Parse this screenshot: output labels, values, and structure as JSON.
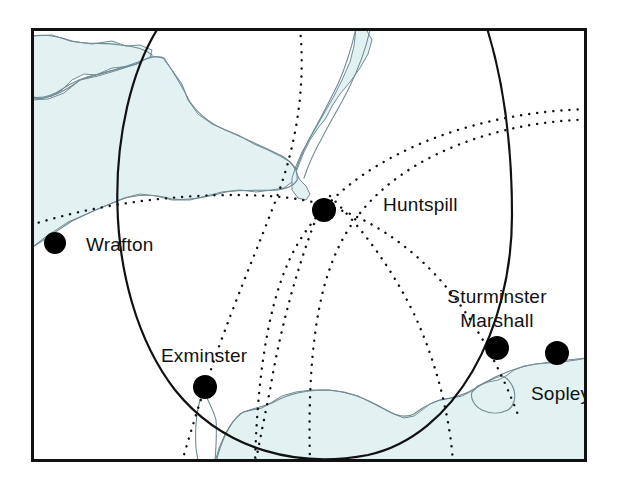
{
  "figure": {
    "type": "locator-map",
    "frame": {
      "x": 31,
      "y": 28,
      "width": 556,
      "height": 434,
      "stroke": "#111111",
      "stroke_width": 3,
      "fill": "#ffffff"
    },
    "colors": {
      "land": "#ffffff",
      "sea": "#e2f1f2",
      "coastline": "#6f8b93",
      "marker": "#000000",
      "label": "#111111",
      "solid_arc": "#111111",
      "dotted_arc": "#111111",
      "page_background": "#ffffff"
    }
  },
  "labels": [
    {
      "id": "wrafton",
      "text": "Wrafton",
      "x": 86,
      "y": 251,
      "anchor": "start",
      "lines": [
        "Wrafton"
      ]
    },
    {
      "id": "huntspill",
      "text": "Huntspill",
      "x": 383,
      "y": 211,
      "anchor": "start",
      "lines": [
        "Huntspill"
      ]
    },
    {
      "id": "sturminster-marshall",
      "text": "Sturminster Marshall",
      "x": 497,
      "y": 303,
      "anchor": "middle",
      "lines": [
        "Sturminster",
        "Marshall"
      ]
    },
    {
      "id": "exminster",
      "text": "Exminster",
      "x": 161,
      "y": 362,
      "anchor": "start",
      "lines": [
        "Exminster"
      ]
    },
    {
      "id": "sopley",
      "text": "Sopley",
      "x": 531,
      "y": 400,
      "anchor": "start",
      "lines": [
        "Sopley"
      ]
    }
  ],
  "markers": [
    {
      "id": "wrafton",
      "name": "Wrafton",
      "cx": 55,
      "cy": 243,
      "r": 11
    },
    {
      "id": "huntspill",
      "name": "Huntspill",
      "cx": 324,
      "cy": 210,
      "r": 12
    },
    {
      "id": "exminster",
      "name": "Exminster",
      "cx": 205,
      "cy": 387,
      "r": 12
    },
    {
      "id": "sturminster-marshall",
      "name": "Sturminster Marshall",
      "cx": 497,
      "cy": 348,
      "r": 12
    },
    {
      "id": "sopley",
      "name": "Sopley",
      "cx": 557,
      "cy": 353,
      "r": 12
    },
    {
      "id": "unlabelled-north",
      "name": "",
      "cx": 324,
      "cy": 210,
      "r": 0
    }
  ],
  "solid_arcs": [
    {
      "id": "main-range-ring",
      "style": "solid",
      "stroke_width": 2.2,
      "path": "M 158 28 C 104 115, 98 290, 175 390 C 225 452, 300 468, 368 455 C 455 436, 512 330, 512 215 C 512 140, 503 80, 487 28"
    }
  ],
  "dotted_arcs": [
    {
      "id": "arc-a",
      "style": "dotted",
      "path": "M 300 28 C 305 78, 300 140, 272 210 C 250 268, 215 345, 182 462"
    },
    {
      "id": "arc-b",
      "style": "dotted",
      "path": "M 31 225 C 110 200, 200 192, 268 196 C 320 199, 360 213, 400 243 C 450 280, 490 340, 520 420"
    },
    {
      "id": "arc-c",
      "style": "dotted",
      "path": "M 618 110 C 560 106, 480 117, 415 146 C 360 171, 325 200, 300 240 C 272 285, 258 360, 255 462"
    },
    {
      "id": "arc-d",
      "style": "dotted",
      "path": "M 618 120 C 545 116, 470 133, 415 166 C 372 192, 345 225, 330 268 C 312 318, 308 390, 310 462"
    },
    {
      "id": "arc-e",
      "style": "dotted",
      "path": "M 330 196 C 362 228, 392 268, 415 316 C 438 366, 450 420, 453 462"
    },
    {
      "id": "arc-f",
      "style": "dotted",
      "path": "M 314 224 C 296 272, 280 330, 270 390 C 263 425, 258 448, 256 462"
    }
  ],
  "coastlines": [
    {
      "id": "south-wales-coast",
      "kind": "sea-polygon",
      "path": "M 31 36 L 52 35 L 70 41 L 92 44 L 112 41 L 126 46 L 140 45 L 152 50 L 150 58 L 132 66 L 112 68 L 96 75 L 84 74 L 72 80 L 62 90 L 52 96 L 40 99 L 31 97 Z"
    },
    {
      "id": "bristol-channel-sea",
      "kind": "sea-polygon",
      "path": "M 31 100 L 48 99 L 64 93 L 80 80 L 98 76 L 118 70 L 136 64 L 152 56 L 163 58 L 172 70 L 182 84 L 188 100 L 198 114 L 212 124 L 226 130 L 240 136 L 254 144 L 268 150 L 280 156 L 290 162 L 296 170 L 292 182 L 284 188 L 272 190 L 256 192 L 240 190 L 222 192 L 206 196 L 190 200 L 172 200 L 156 196 L 140 194 L 124 198 L 110 204 L 96 210 L 82 216 L 68 222 L 56 230 L 44 238 L 34 246 L 31 248 Z"
    },
    {
      "id": "severn-estuary",
      "kind": "sea-polygon",
      "path": "M 356 28 L 366 29 L 372 40 L 368 54 L 360 68 L 350 82 L 340 94 L 332 106 L 326 118 L 318 128 L 310 140 L 304 152 L 300 162 L 296 172 L 300 180 L 306 186 L 310 194 L 306 200 L 298 198 L 292 190 L 292 178 L 296 166 L 302 152 L 310 138 L 318 124 L 326 110 L 334 96 L 342 80 L 350 62 L 354 46 Z"
    },
    {
      "id": "somerset-shore-line",
      "kind": "line",
      "path": "M 31 99 C 50 99, 64 92, 80 80 C 96 74, 118 70, 138 62 C 150 57, 158 55, 164 58 C 172 70, 182 86, 190 102 C 200 116, 214 126, 230 132 C 248 140, 266 148, 282 156 C 292 162, 298 170, 297 178"
    },
    {
      "id": "north-devon-shore-line",
      "kind": "line",
      "path": "M 31 248 C 44 240, 58 230, 72 221 C 88 213, 104 206, 120 200 C 136 194, 154 194, 172 199 C 190 201, 208 197, 226 192 C 244 189, 262 191, 278 190 C 290 188, 296 184, 298 178"
    },
    {
      "id": "north-wales-inland-line",
      "kind": "line",
      "path": "M 31 36 C 44 34, 58 36, 72 41 C 88 45, 104 42, 120 45 C 134 46, 146 50, 152 55"
    },
    {
      "id": "wales-lower-line",
      "kind": "line",
      "path": "M 31 97 C 42 99, 54 95, 64 88 C 76 80, 88 76, 100 74 C 114 70, 128 67, 140 63"
    },
    {
      "id": "severn-west-line",
      "kind": "line",
      "path": "M 356 28 C 352 46, 346 66, 338 84 C 330 100, 322 116, 314 130 C 306 144, 300 158, 296 170"
    },
    {
      "id": "severn-east-line",
      "kind": "line",
      "path": "M 370 30 C 366 48, 358 70, 348 90 C 340 106, 330 122, 322 138 C 314 152, 308 166, 304 178"
    },
    {
      "id": "english-channel-sea",
      "kind": "sea-polygon",
      "path": "M 215 462 L 219 448 L 226 432 L 234 420 L 243 412 L 252 410 L 262 408 L 272 402 L 282 396 L 296 392 L 312 390 L 328 390 L 344 392 L 358 396 L 370 402 L 382 408 L 394 414 L 404 418 L 414 416 L 422 410 L 430 404 L 440 400 L 452 398 L 462 396 L 470 392 L 478 386 L 488 382 L 498 380 L 506 376 L 514 370 L 524 366 L 536 364 L 548 363 L 562 362 L 576 360 L 587 358 L 587 462 Z"
    },
    {
      "id": "dorset-shore-line",
      "kind": "line",
      "path": "M 216 462 C 221 442, 229 424, 240 414 C 250 408, 262 408, 274 402 C 288 394, 306 390, 326 390 C 348 391, 368 399, 386 410 C 396 416, 406 418, 414 414 C 424 406, 436 400, 450 398 C 462 396, 474 390, 484 383 C 496 376, 510 370, 526 366 C 544 362, 566 360, 587 358"
    },
    {
      "id": "poole-harbour-inlet",
      "kind": "line",
      "path": "M 478 386 C 486 382, 494 378, 502 376 C 508 378, 512 384, 514 390 C 516 398, 514 406, 508 410 C 500 414, 490 414, 482 410 C 474 406, 470 398, 472 392 Z"
    },
    {
      "id": "exe-estuary-inlet",
      "kind": "line",
      "path": "M 206 396 C 210 404, 214 412, 216 420 C 217 432, 216 448, 215 462"
    },
    {
      "id": "exe-estuary-inlet-west",
      "kind": "line",
      "path": "M 200 400 C 196 414, 195 432, 196 448 C 197 455, 198 459, 198 462"
    }
  ]
}
